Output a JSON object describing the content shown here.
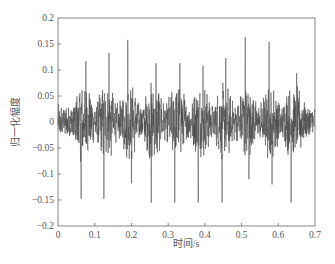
{
  "chart_data": {
    "type": "line",
    "title": "",
    "xlabel": "时间/s",
    "ylabel": "归一化幅度",
    "xlim": [
      0,
      0.7
    ],
    "ylim": [
      -0.2,
      0.2
    ],
    "xticks": [
      0,
      0.1,
      0.2,
      0.3,
      0.4,
      0.5,
      0.6,
      0.7
    ],
    "xtick_labels": [
      "0",
      "0.1",
      "0.2",
      "0.3",
      "0.4",
      "0.5",
      "0.6",
      "0.7"
    ],
    "yticks": [
      0.2,
      0.15,
      0.1,
      0.05,
      0,
      -0.05,
      -0.1,
      -0.15,
      -0.2
    ],
    "ytick_labels": [
      "0.2",
      "0.15",
      "0.1",
      "0.05",
      "0",
      "−0.05",
      "−0.1",
      "−0.15",
      "−0.2"
    ],
    "grid": false,
    "legend": null,
    "line_color": "#4a4a4a",
    "series": [
      {
        "name": "normalized signal",
        "description": "noisy oscillating waveform around 0 (approx. ±0.03 baseline, bursts to ±0.07) with periodic impulse spikes",
        "positive_spikes": [
          {
            "t": 0.076,
            "y": 0.117
          },
          {
            "t": 0.139,
            "y": 0.133
          },
          {
            "t": 0.19,
            "y": 0.158
          },
          {
            "t": 0.267,
            "y": 0.113
          },
          {
            "t": 0.332,
            "y": 0.113
          },
          {
            "t": 0.395,
            "y": 0.108
          },
          {
            "t": 0.457,
            "y": 0.123
          },
          {
            "t": 0.51,
            "y": 0.163
          },
          {
            "t": 0.575,
            "y": 0.154
          },
          {
            "t": 0.65,
            "y": 0.094
          }
        ],
        "negative_spikes": [
          {
            "t": 0.063,
            "y": -0.148
          },
          {
            "t": 0.125,
            "y": -0.148
          },
          {
            "t": 0.2,
            "y": -0.118
          },
          {
            "t": 0.254,
            "y": -0.155
          },
          {
            "t": 0.318,
            "y": -0.155
          },
          {
            "t": 0.382,
            "y": -0.155
          },
          {
            "t": 0.447,
            "y": -0.155
          },
          {
            "t": 0.52,
            "y": -0.11
          },
          {
            "t": 0.583,
            "y": -0.12
          },
          {
            "t": 0.635,
            "y": -0.155
          }
        ],
        "baseline_amplitude": 0.03,
        "burst_amplitude": 0.07
      }
    ]
  },
  "caption": {
    "text": ""
  }
}
